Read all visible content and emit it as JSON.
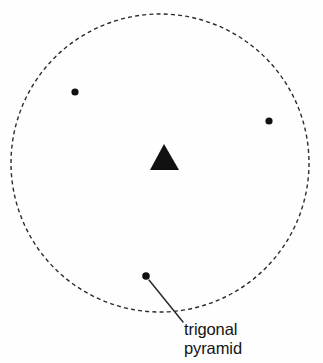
{
  "figure": {
    "background_color": "#fefefe",
    "ink_color": "#1a1a1a"
  },
  "boundary": {
    "shape_name": "dashed-circle",
    "style": "dashed",
    "center_x": 160,
    "center_y": 163,
    "radius": 149,
    "stroke_color": "#2b2b2b",
    "stroke_width": 1.4,
    "dash_length": 4,
    "gap_length": 3.2
  },
  "center_marker": {
    "shape_name": "filled-triangle",
    "fill_color": "#111111",
    "apex_x": 164,
    "apex_y": 144,
    "left_x": 150,
    "left_y": 170,
    "right_x": 179,
    "right_y": 170
  },
  "dots": [
    {
      "name": "dot-upper-left",
      "cx": 75,
      "cy": 92,
      "r": 3.6,
      "fill": "#111111"
    },
    {
      "name": "dot-right",
      "cx": 269,
      "cy": 121,
      "r": 3.6,
      "fill": "#111111"
    },
    {
      "name": "dot-bottom",
      "cx": 146,
      "cy": 276,
      "r": 3.8,
      "fill": "#111111"
    }
  ],
  "leader_line": {
    "name": "leader-line-trigonal-pyramid",
    "x1": 149,
    "y1": 280,
    "x2": 183,
    "y2": 322,
    "stroke_color": "#2b2b2b",
    "stroke_width": 1.5
  },
  "annotation": {
    "name": "trigonal-pyramid-label",
    "line1": "trigonal",
    "line2": "pyramid",
    "full_text": "trigonal pyramid",
    "x": 184,
    "y": 320,
    "font_size": 16.5,
    "color": "#141414"
  },
  "chart_data": {
    "type": "scatter",
    "title": "trigonal pyramid",
    "xlabel": "",
    "ylabel": "",
    "x": [
      75,
      269,
      146,
      164
    ],
    "y": [
      92,
      121,
      276,
      157
    ],
    "point_labels": [
      "",
      "",
      "trigonal pyramid",
      ""
    ],
    "markers": [
      "circle",
      "circle",
      "circle",
      "triangle"
    ],
    "annotations": [
      "trigonal pyramid"
    ],
    "legend": [],
    "grid": false,
    "xlim": [
      0,
      323
    ],
    "ylim": [
      0,
      363
    ]
  }
}
